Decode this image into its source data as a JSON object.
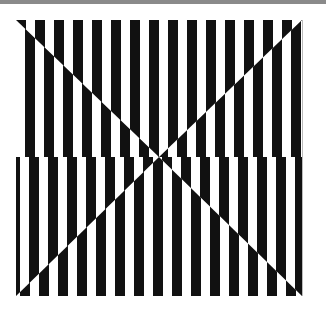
{
  "artwork": {
    "description": "Op-art black and white vertical stripes with diagonal X-shaped phase shifts",
    "colors": {
      "stripe": "#111111",
      "background": "#ffffff",
      "topbar": "#8a8a8a"
    },
    "frame": {
      "x": 16,
      "y": 20,
      "width": 286,
      "height": 276
    },
    "stripe_period": 19,
    "stripe_width": 10,
    "horizon_y": 157
  }
}
